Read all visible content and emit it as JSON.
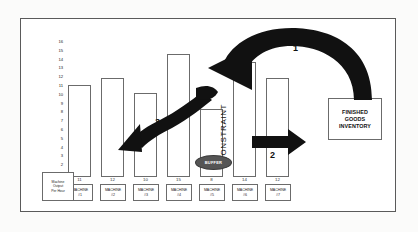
{
  "diagram": {
    "title_hidden": "",
    "axis": {
      "ticks": [
        "16",
        "15",
        "14",
        "13",
        "12",
        "11",
        "10",
        "9",
        "8",
        "7",
        "6",
        "5",
        "4",
        "3",
        "2",
        "1"
      ],
      "max": 16,
      "min": 1
    },
    "legend_box": {
      "line1": "Machine",
      "line2": "Output",
      "line3": "Per Hour"
    },
    "machines": [
      {
        "value": "11",
        "label_line1": "MACHINE",
        "label_line2": "#1"
      },
      {
        "value": "12",
        "label_line1": "MACHINE",
        "label_line2": "#2"
      },
      {
        "value": "10",
        "label_line1": "MACHINE",
        "label_line2": "#3"
      },
      {
        "value": "15",
        "label_line1": "MACHINE",
        "label_line2": "#4"
      },
      {
        "value": "8",
        "label_line1": "MACHINE",
        "label_line2": "#5"
      },
      {
        "value": "14",
        "label_line1": "MACHINE",
        "label_line2": "#6"
      },
      {
        "value": "12",
        "label_line1": "MACHINE",
        "label_line2": "#7"
      }
    ],
    "constraint_label": "CONSTRAINT",
    "buffer_label": "BUFFER",
    "finished_goods": {
      "line1": "FINISHED",
      "line2": "GOODS",
      "line3": "INVENTORY"
    },
    "arrows": [
      {
        "id": "1",
        "label": "1"
      },
      {
        "id": "2",
        "label": "2"
      },
      {
        "id": "3",
        "label": "3"
      }
    ],
    "colors": {
      "frame": "#5a5a5a",
      "bar_outline": "#6b6b6b",
      "arrow": "#111111",
      "buffer_fill": "#555555",
      "background": "#ffffff",
      "page": "#fbfbfa"
    }
  },
  "chart_data": {
    "type": "bar",
    "title": "",
    "xlabel": "",
    "ylabel": "Machine Output Per Hour",
    "categories": [
      "MACHINE #1",
      "MACHINE #2",
      "MACHINE #3",
      "MACHINE #4",
      "MACHINE #5",
      "MACHINE #6",
      "MACHINE #7"
    ],
    "values": [
      11,
      12,
      10,
      15,
      8,
      14,
      12
    ],
    "ylim": [
      0,
      16
    ],
    "yticks": [
      1,
      2,
      3,
      4,
      5,
      6,
      7,
      8,
      9,
      10,
      11,
      12,
      13,
      14,
      15,
      16
    ],
    "grid": false,
    "legend": "none",
    "annotations": [
      {
        "text": "CONSTRAINT",
        "at": "MACHINE #5",
        "orientation": "vertical"
      },
      {
        "text": "BUFFER",
        "at": "before MACHINE #5",
        "shape": "ellipse"
      },
      {
        "text": "FINISHED GOODS INVENTORY",
        "at": "right of MACHINE #7",
        "shape": "box"
      },
      {
        "text": "1",
        "shape": "curved-arrow",
        "from": "FINISHED GOODS INVENTORY",
        "to": "BUFFER"
      },
      {
        "text": "2",
        "shape": "straight-arrow",
        "from": "MACHINE #6",
        "to": "MACHINE #7"
      },
      {
        "text": "3",
        "shape": "curved-arrow",
        "from": "MACHINE #4",
        "to": "MACHINE #1"
      }
    ]
  }
}
